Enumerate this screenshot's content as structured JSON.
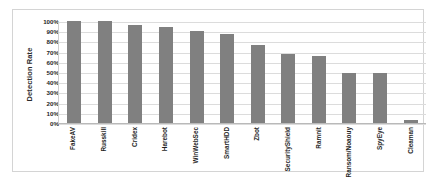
{
  "chart_data": {
    "type": "bar",
    "title": "",
    "xlabel": "",
    "ylabel": "Detection Rate",
    "ylim": [
      0,
      100
    ],
    "ytick_labels": [
      "100%",
      "90%",
      "80%",
      "70%",
      "60%",
      "50%",
      "40%",
      "30%",
      "20%",
      "10%",
      "0%"
    ],
    "ytick_values": [
      100,
      90,
      80,
      70,
      60,
      50,
      40,
      30,
      20,
      10,
      0
    ],
    "grid": true,
    "legend": false,
    "bar_color": "#808080",
    "categories": [
      "FakeAV",
      "Russkill",
      "Cridex",
      "Harebot",
      "WinWebSec",
      "SmartHDD",
      "Zbot",
      "SecurityShield",
      "Ramnit",
      "Ransom/Noaouy",
      "SpyEye",
      "Cleaman"
    ],
    "values": [
      100,
      100,
      96,
      94,
      90,
      87,
      76,
      68,
      66,
      49,
      49,
      3
    ]
  }
}
